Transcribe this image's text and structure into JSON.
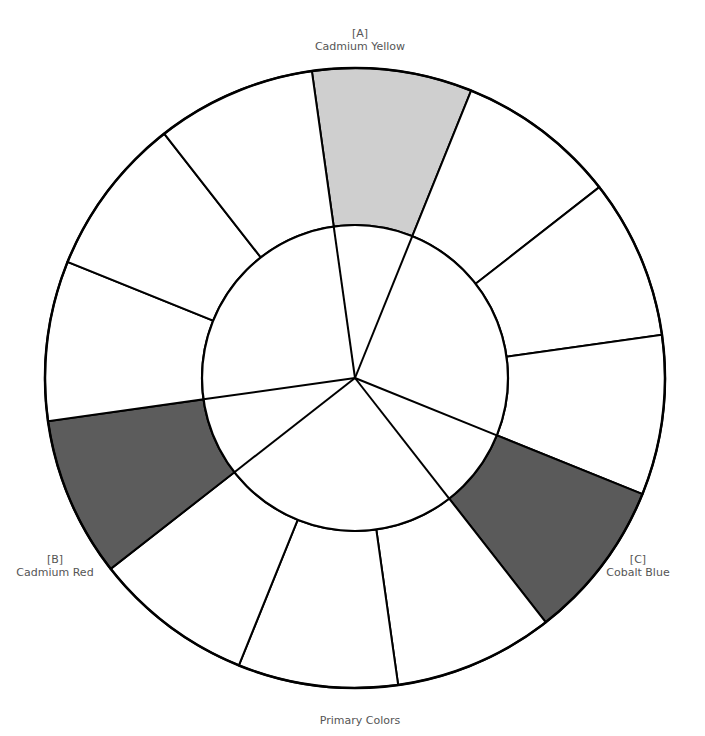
{
  "title": "Primary Colors",
  "wheel": {
    "center": [
      355,
      378
    ],
    "outer_radius": 310,
    "inner_radius": 153,
    "segments": 12,
    "line_color": "#000000",
    "blank_fill": "#ffffff"
  },
  "primaries": [
    {
      "marker": "[A]",
      "name": "Cadmium Yellow",
      "fill": "#cfcfcf"
    },
    {
      "marker": "[B]",
      "name": "Cadmium Red",
      "fill": "#5c5c5c"
    },
    {
      "marker": "[C]",
      "name": "Cobalt Blue",
      "fill": "#5a5a5a"
    }
  ]
}
